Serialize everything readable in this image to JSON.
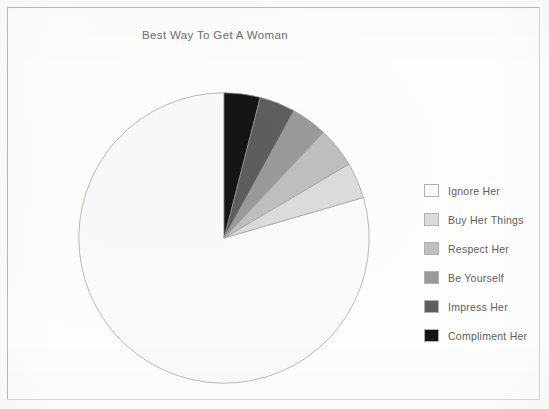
{
  "chart_title": "Best Way To Get A Woman",
  "frame": {
    "border_color": "#b9b9b9"
  },
  "legend": {
    "position": "right",
    "items": [
      {
        "label": "Ignore Her",
        "color": "#fafafa"
      },
      {
        "label": "Buy Her Things",
        "color": "#dcdcdc"
      },
      {
        "label": "Respect Her",
        "color": "#bfbfbf"
      },
      {
        "label": "Be Yourself",
        "color": "#9a9a9a"
      },
      {
        "label": "Impress Her",
        "color": "#5e5e5e"
      },
      {
        "label": "Compliment Her",
        "color": "#151515"
      }
    ]
  },
  "chart_data": {
    "type": "pie",
    "title": "Best Way To Get A Woman",
    "xlabel": "",
    "ylabel": "",
    "legend_position": "right",
    "grid": false,
    "start_angle_deg": 90,
    "direction": "counterclockwise",
    "labels": [
      "Ignore Her",
      "Buy Her Things",
      "Respect Her",
      "Be Yourself",
      "Impress Her",
      "Compliment Her"
    ],
    "values": [
      79.5,
      4.0,
      4.5,
      4.0,
      4.0,
      4.0
    ],
    "unit": "percent",
    "colors": [
      "#fafafa",
      "#dcdcdc",
      "#bfbfbf",
      "#9a9a9a",
      "#5e5e5e",
      "#151515"
    ],
    "slice_edge_color": "#9e9e9e",
    "annotations": []
  }
}
